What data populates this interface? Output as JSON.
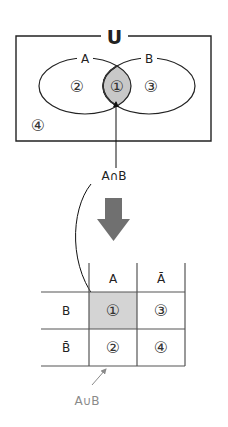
{
  "venn": {
    "universe_label": "U",
    "set_a_label": "A",
    "set_b_label": "B",
    "regions": {
      "intersection": "①",
      "a_only": "②",
      "b_only": "③",
      "outside": "④"
    },
    "intersection_fill": "#c8c8c8"
  },
  "intersection_label": "A∩B",
  "transform_arrow": {
    "icon": "down-arrow-icon",
    "color": "#707070"
  },
  "table": {
    "col_headers": [
      "A",
      "Ā"
    ],
    "row_headers": [
      "B",
      "B̄"
    ],
    "cells": [
      [
        "①",
        "③"
      ],
      [
        "②",
        "④"
      ]
    ],
    "highlight_cell_fill": "#d4d4d4"
  },
  "union_label": "A∪B"
}
